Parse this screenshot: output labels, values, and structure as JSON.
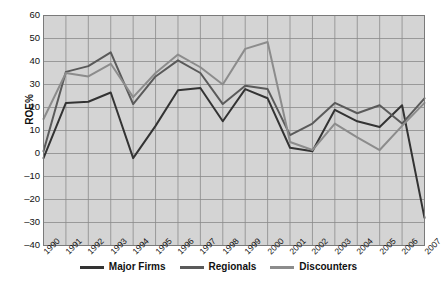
{
  "chart_data": {
    "type": "line",
    "title": "",
    "xlabel": "",
    "ylabel": "ROE%",
    "ylim": [
      -40,
      60
    ],
    "ytick_values": [
      60,
      50,
      40,
      30,
      20,
      10,
      0,
      -10,
      -20,
      -30,
      -40
    ],
    "ytick_labels": [
      "60",
      "50",
      "40",
      "30",
      "20",
      "10",
      "0",
      "–10",
      "–20",
      "–30",
      "–40"
    ],
    "grid": true,
    "legend_position": "bottom",
    "categories": [
      "1990",
      "1991",
      "1992",
      "1993",
      "1994",
      "1995",
      "1996",
      "1997",
      "1998",
      "1999",
      "2000",
      "2001",
      "2002",
      "2003",
      "2004",
      "2005",
      "2006",
      "2007"
    ],
    "series": [
      {
        "name": "Major Firms",
        "color": "#333333",
        "values": [
          -2,
          22,
          22.5,
          26.5,
          -2,
          12,
          27.5,
          28.5,
          14,
          28,
          24,
          2.5,
          1,
          19,
          14,
          11.5,
          21,
          -28
        ]
      },
      {
        "name": "Regionals",
        "color": "#5a5a5a",
        "values": [
          1,
          35.5,
          38,
          44,
          21.5,
          33.5,
          40.5,
          35,
          21.5,
          29.5,
          28,
          8,
          13,
          22,
          17.5,
          21,
          13,
          24
        ]
      },
      {
        "name": "Discounters",
        "color": "#8c8c8c",
        "values": [
          15,
          35,
          33.5,
          39,
          24.5,
          35,
          43,
          37.5,
          30,
          45.5,
          48.5,
          5,
          1.5,
          13,
          7,
          1.5,
          12,
          22
        ]
      }
    ]
  },
  "legend": {
    "items": [
      {
        "label": "Major Firms",
        "color": "#333333"
      },
      {
        "label": "Regionals",
        "color": "#5a5a5a"
      },
      {
        "label": "Discounters",
        "color": "#8c8c8c"
      }
    ]
  },
  "plot": {
    "background": "#d4d4d4",
    "grid_color": "#8a8a8a",
    "border_color": "#7a7a7a"
  }
}
